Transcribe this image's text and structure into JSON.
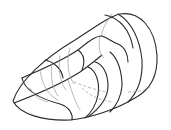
{
  "figure": {
    "colors": {
      "background": "#ffffff",
      "outline": "#2a2a2a",
      "hidden_lines": "#9a9a9a"
    }
  }
}
